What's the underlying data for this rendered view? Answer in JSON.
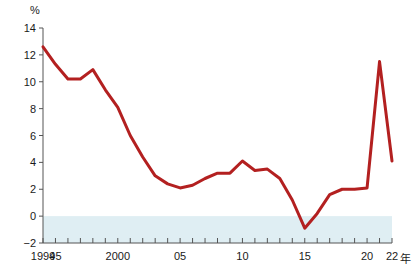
{
  "chart_data": {
    "type": "line",
    "title": "",
    "subtitle": "",
    "xlabel": "年",
    "ylabel": "%",
    "unit_label": "%",
    "x": [
      1994,
      1995,
      1996,
      1997,
      1998,
      1999,
      2000,
      2001,
      2002,
      2003,
      2004,
      2005,
      2006,
      2007,
      2008,
      2009,
      2010,
      2011,
      2012,
      2013,
      2014,
      2015,
      2016,
      2017,
      2018,
      2019,
      2020,
      2021,
      2022
    ],
    "values": [
      12.6,
      11.3,
      10.2,
      10.2,
      10.9,
      9.4,
      8.1,
      6.0,
      4.4,
      3.0,
      2.4,
      2.1,
      2.3,
      2.8,
      3.2,
      3.2,
      4.1,
      3.4,
      3.5,
      2.8,
      1.2,
      -0.9,
      0.2,
      1.6,
      2.0,
      2.0,
      2.1,
      11.5,
      4.1
    ],
    "series": [
      {
        "name": "series-1",
        "color": "#b32020",
        "values": [
          12.6,
          11.3,
          10.2,
          10.2,
          10.9,
          9.4,
          8.1,
          6.0,
          4.4,
          3.0,
          2.4,
          2.1,
          2.3,
          2.8,
          3.2,
          3.2,
          4.1,
          3.4,
          3.5,
          2.8,
          1.2,
          -0.9,
          0.2,
          1.6,
          2.0,
          2.0,
          2.1,
          11.5,
          4.1
        ]
      }
    ],
    "ylim": [
      -2,
      14
    ],
    "xlim": [
      1994,
      2022
    ],
    "ytick_values": [
      -2,
      0,
      2,
      4,
      6,
      8,
      10,
      12,
      14
    ],
    "ytick_labels": [
      "−2",
      "0",
      "2",
      "4",
      "6",
      "8",
      "10",
      "12",
      "14"
    ],
    "xtick_values": [
      1994,
      1995,
      2000,
      2005,
      2010,
      2015,
      2020,
      2022
    ],
    "xtick_labels": [
      "1994",
      "95",
      "2000",
      "05",
      "10",
      "15",
      "20",
      "22"
    ],
    "xtick_minor_every": 1,
    "grid": false,
    "legend": "none",
    "negative_band": {
      "from": -2,
      "to": 0,
      "color": "#dfeef3",
      "label": ""
    },
    "colors": {
      "line": "#b32020",
      "axis": "#555555",
      "text": "#1a1a1a",
      "background": "#ffffff",
      "negative_band": "#dfeef3"
    }
  }
}
